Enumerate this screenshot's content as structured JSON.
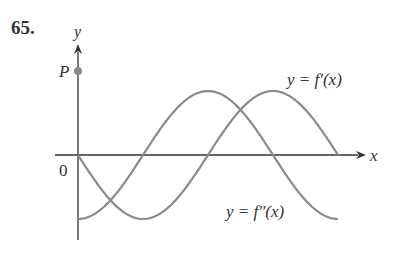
{
  "problem": {
    "number": "65."
  },
  "chart_data": {
    "type": "line",
    "title": "",
    "xlabel": "x",
    "ylabel": "y",
    "origin_label": "0",
    "point": {
      "label": "P",
      "description": "point on y-axis above the curves' maximum"
    },
    "grid": false,
    "legend": "inline labels",
    "period_fraction_shown": 1,
    "series": [
      {
        "name": "y = f'(x)",
        "shape": "-sin(x)",
        "x": [
          0,
          0.25,
          0.5,
          0.75,
          1.0
        ],
        "y": [
          0,
          -1,
          0,
          1,
          0
        ]
      },
      {
        "name": "y = f''(x)",
        "shape": "-cos(x)",
        "x": [
          0,
          0.25,
          0.5,
          0.75,
          1.0
        ],
        "y": [
          -1,
          0,
          1,
          0,
          -1
        ]
      }
    ],
    "labels": {
      "fprime": "y = f′(x)",
      "fdoubleprime": "y = f″(x)"
    },
    "colors": {
      "curves": "#8a8a8a",
      "axes": "#333333",
      "point": "#8a8a8a"
    }
  }
}
